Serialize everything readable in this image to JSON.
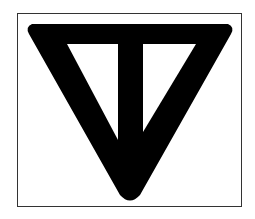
{
  "figure": {
    "symbol": "inverted-triangle-with-vertical-bar-icon",
    "stroke_color": "#000000",
    "background_color": "#ffffff",
    "frame_color": "#333333"
  }
}
